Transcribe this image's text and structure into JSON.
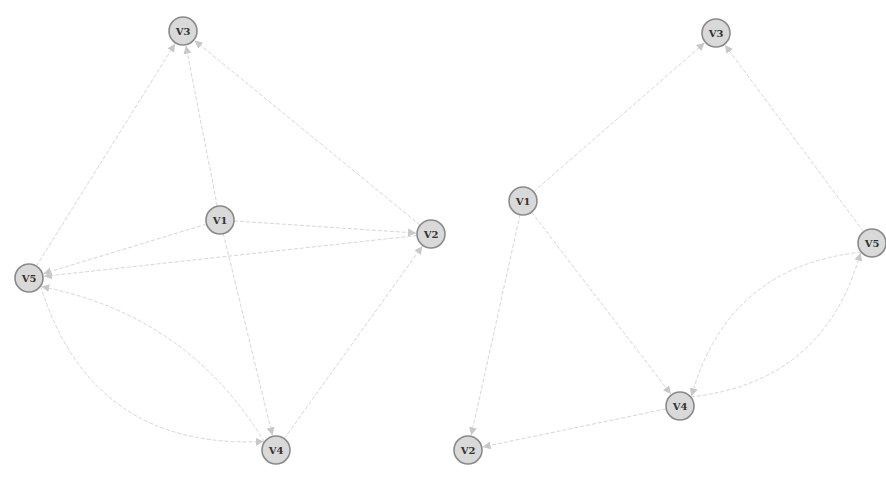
{
  "style": {
    "background": "#ffffff",
    "node_fill": "#d9d9d9",
    "node_stroke": "#8a8a8a",
    "edge_color": "#d6d6d6",
    "arrow_color": "#c8c8c8",
    "label_color": "#333333",
    "node_radius": 14
  },
  "graphs": [
    {
      "id": "left",
      "nodes": [
        {
          "id": "V1",
          "label": "V1",
          "x": 220,
          "y": 220
        },
        {
          "id": "V2",
          "label": "V2",
          "x": 431,
          "y": 234
        },
        {
          "id": "V3",
          "label": "V3",
          "x": 183,
          "y": 31
        },
        {
          "id": "V4",
          "label": "V4",
          "x": 276,
          "y": 450
        },
        {
          "id": "V5",
          "label": "V5",
          "x": 29,
          "y": 278
        }
      ],
      "edges": [
        {
          "from": "V5",
          "to": "V3",
          "curve": 0
        },
        {
          "from": "V1",
          "to": "V3",
          "curve": 0
        },
        {
          "from": "V2",
          "to": "V3",
          "curve": 0
        },
        {
          "from": "V1",
          "to": "V2",
          "curve": 0
        },
        {
          "from": "V1",
          "to": "V5",
          "curve": 0
        },
        {
          "from": "V2",
          "to": "V5",
          "curve": 0
        },
        {
          "from": "V1",
          "to": "V4",
          "curve": 0
        },
        {
          "from": "V4",
          "to": "V2",
          "curve": 0
        },
        {
          "from": "V5",
          "to": "V4",
          "curve": 0.35
        },
        {
          "from": "V4",
          "to": "V5",
          "curve": 0.2
        }
      ]
    },
    {
      "id": "right",
      "nodes": [
        {
          "id": "V1",
          "label": "V1",
          "x": 523,
          "y": 201
        },
        {
          "id": "V2",
          "label": "V2",
          "x": 468,
          "y": 450
        },
        {
          "id": "V3",
          "label": "V3",
          "x": 716,
          "y": 33
        },
        {
          "id": "V4",
          "label": "V4",
          "x": 680,
          "y": 406
        },
        {
          "id": "V5",
          "label": "V5",
          "x": 872,
          "y": 243
        }
      ],
      "edges": [
        {
          "from": "V1",
          "to": "V3",
          "curve": 0
        },
        {
          "from": "V5",
          "to": "V3",
          "curve": 0
        },
        {
          "from": "V1",
          "to": "V2",
          "curve": 0
        },
        {
          "from": "V1",
          "to": "V4",
          "curve": 0
        },
        {
          "from": "V4",
          "to": "V2",
          "curve": 0
        },
        {
          "from": "V5",
          "to": "V4",
          "curve": 0.3
        },
        {
          "from": "V4",
          "to": "V5",
          "curve": 0.3
        }
      ]
    }
  ]
}
